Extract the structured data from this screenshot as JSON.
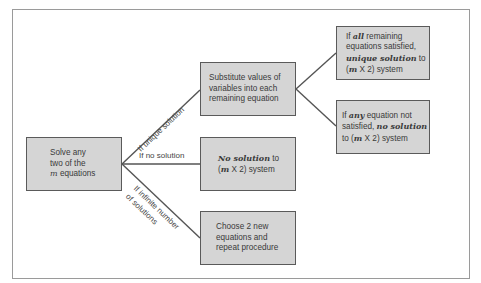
{
  "diagram": {
    "start": {
      "lines": [
        "Solve any",
        "two of the",
        "equations"
      ],
      "var": "m"
    },
    "branch_labels": {
      "unique": "If unique solution",
      "none": "If no solution",
      "infinite_1": "If infinite number",
      "infinite_2": "of solutions"
    },
    "substitute": {
      "lines": [
        "Substitute values of",
        "variables into each",
        "remaining equation"
      ]
    },
    "no_solution": {
      "em": "No solution",
      "rest1": " to",
      "line2_var": "m",
      "line2_rest": " X 2) system",
      "line2_open": "("
    },
    "choose_new": {
      "lines": [
        "Choose 2 new",
        "equations and",
        "repeat procedure"
      ]
    },
    "all_satisfied": {
      "l1_pre": "If ",
      "l1_em": "all",
      "l1_post": " remaining",
      "l2": "equations satisfied,",
      "l3_em": "unique solution",
      "l3_post": " to",
      "l4_open": "(",
      "l4_var": "m",
      "l4_rest": " X 2) system"
    },
    "any_not_satisfied": {
      "l1_pre": "If ",
      "l1_em": "any",
      "l1_post": " equation not",
      "l2_pre": "satisfied, ",
      "l2_em": "no solution",
      "l3_pre": "to (",
      "l3_var": "m",
      "l3_rest": " X 2) system"
    },
    "colors": {
      "box_fill": "#d5d5d5",
      "box_border": "#5a5a5a",
      "line": "#555555",
      "frame": "#9a9a9a"
    }
  }
}
